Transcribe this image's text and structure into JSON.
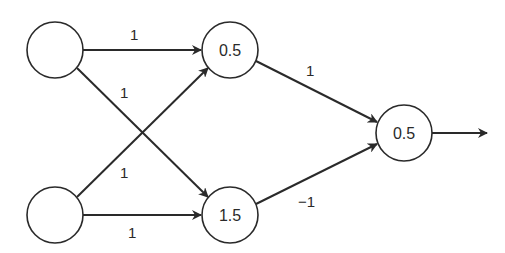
{
  "diagram": {
    "title": "",
    "nodes": [
      {
        "id": "in1",
        "label": "",
        "cx": 55,
        "cy": 50
      },
      {
        "id": "in2",
        "label": "",
        "cx": 55,
        "cy": 215
      },
      {
        "id": "h1",
        "label": "0.5",
        "cx": 230,
        "cy": 50
      },
      {
        "id": "h2",
        "label": "1.5",
        "cx": 230,
        "cy": 215
      },
      {
        "id": "out",
        "label": "0.5",
        "cx": 404,
        "cy": 133
      }
    ],
    "edges": [
      {
        "from": "in1",
        "to": "h1",
        "weight": "1"
      },
      {
        "from": "in1",
        "to": "h2",
        "weight": "1"
      },
      {
        "from": "in2",
        "to": "h1",
        "weight": "1"
      },
      {
        "from": "in2",
        "to": "h2",
        "weight": "1"
      },
      {
        "from": "h1",
        "to": "out",
        "weight": "1"
      },
      {
        "from": "h2",
        "to": "out",
        "weight": "−1"
      }
    ],
    "output_arrow": true,
    "colors": {
      "stroke": "#2a2a2a",
      "background": "#ffffff"
    }
  }
}
